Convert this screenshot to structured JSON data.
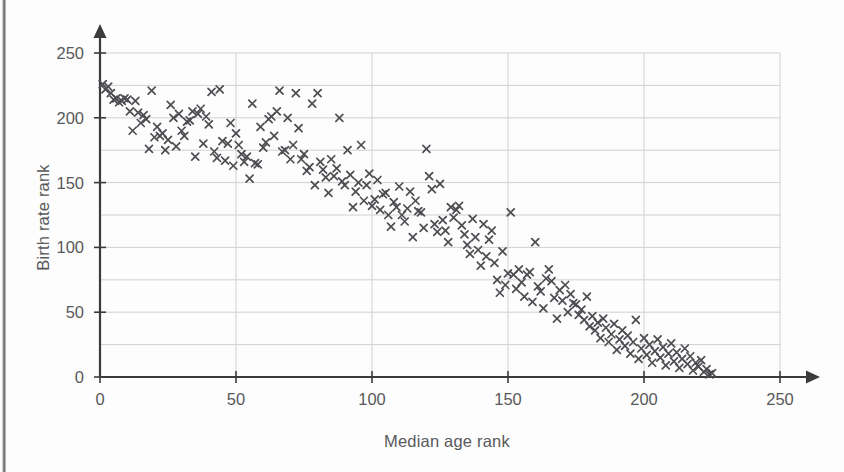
{
  "chart_data": {
    "type": "scatter",
    "title": "",
    "xlabel": "Median age rank",
    "ylabel": "Birth rate rank",
    "xlim": [
      0,
      250
    ],
    "ylim": [
      0,
      250
    ],
    "x_ticks": [
      0,
      50,
      100,
      150,
      200,
      250
    ],
    "y_ticks": [
      0,
      50,
      100,
      150,
      200,
      250
    ],
    "x_tick_labels": [
      "0",
      "50",
      "100",
      "150",
      "200",
      "250"
    ],
    "y_tick_labels": [
      "0",
      "50",
      "100",
      "150",
      "200",
      "250"
    ],
    "grid": "horizontal-every-25-and-vertical-every-50",
    "grid_color": "#d0d0d2",
    "marker": "x",
    "marker_color": "#4d4d52",
    "marker_size": 7,
    "legend": "none",
    "axis_style": "arrow-headed axes, origin at bottom-left",
    "n_points": 224,
    "points": [
      [
        1,
        226
      ],
      [
        2,
        222
      ],
      [
        3,
        224
      ],
      [
        4,
        219
      ],
      [
        5,
        214
      ],
      [
        6,
        215
      ],
      [
        7,
        212
      ],
      [
        8,
        213
      ],
      [
        9,
        215
      ],
      [
        10,
        214
      ],
      [
        11,
        205
      ],
      [
        12,
        190
      ],
      [
        13,
        213
      ],
      [
        14,
        204
      ],
      [
        15,
        196
      ],
      [
        16,
        202
      ],
      [
        17,
        199
      ],
      [
        18,
        176
      ],
      [
        19,
        221
      ],
      [
        20,
        185
      ],
      [
        21,
        193
      ],
      [
        22,
        186
      ],
      [
        23,
        188
      ],
      [
        24,
        175
      ],
      [
        25,
        183
      ],
      [
        26,
        210
      ],
      [
        27,
        200
      ],
      [
        28,
        178
      ],
      [
        29,
        203
      ],
      [
        30,
        190
      ],
      [
        31,
        186
      ],
      [
        32,
        197
      ],
      [
        33,
        198
      ],
      [
        34,
        205
      ],
      [
        35,
        170
      ],
      [
        36,
        203
      ],
      [
        37,
        207
      ],
      [
        38,
        180
      ],
      [
        39,
        201
      ],
      [
        40,
        195
      ],
      [
        41,
        220
      ],
      [
        42,
        174
      ],
      [
        43,
        169
      ],
      [
        44,
        222
      ],
      [
        45,
        182
      ],
      [
        46,
        167
      ],
      [
        47,
        180
      ],
      [
        48,
        196
      ],
      [
        49,
        163
      ],
      [
        50,
        188
      ],
      [
        51,
        179
      ],
      [
        52,
        172
      ],
      [
        53,
        166
      ],
      [
        54,
        170
      ],
      [
        55,
        153
      ],
      [
        56,
        211
      ],
      [
        57,
        165
      ],
      [
        58,
        164
      ],
      [
        59,
        193
      ],
      [
        60,
        177
      ],
      [
        61,
        181
      ],
      [
        62,
        199
      ],
      [
        63,
        201
      ],
      [
        64,
        186
      ],
      [
        65,
        205
      ],
      [
        66,
        221
      ],
      [
        67,
        174
      ],
      [
        68,
        175
      ],
      [
        69,
        200
      ],
      [
        70,
        168
      ],
      [
        71,
        179
      ],
      [
        72,
        219
      ],
      [
        73,
        192
      ],
      [
        74,
        168
      ],
      [
        75,
        172
      ],
      [
        76,
        159
      ],
      [
        77,
        162
      ],
      [
        78,
        211
      ],
      [
        79,
        148
      ],
      [
        80,
        219
      ],
      [
        81,
        166
      ],
      [
        82,
        160
      ],
      [
        83,
        154
      ],
      [
        84,
        142
      ],
      [
        85,
        168
      ],
      [
        86,
        155
      ],
      [
        87,
        161
      ],
      [
        88,
        200
      ],
      [
        89,
        151
      ],
      [
        90,
        148
      ],
      [
        91,
        175
      ],
      [
        92,
        156
      ],
      [
        93,
        131
      ],
      [
        94,
        143
      ],
      [
        95,
        150
      ],
      [
        96,
        179
      ],
      [
        97,
        136
      ],
      [
        98,
        148
      ],
      [
        99,
        157
      ],
      [
        100,
        132
      ],
      [
        101,
        137
      ],
      [
        102,
        152
      ],
      [
        103,
        129
      ],
      [
        104,
        141
      ],
      [
        105,
        142
      ],
      [
        106,
        125
      ],
      [
        107,
        116
      ],
      [
        108,
        135
      ],
      [
        109,
        131
      ],
      [
        110,
        147
      ],
      [
        111,
        125
      ],
      [
        112,
        120
      ],
      [
        113,
        130
      ],
      [
        114,
        143
      ],
      [
        115,
        108
      ],
      [
        116,
        136
      ],
      [
        117,
        128
      ],
      [
        118,
        127
      ],
      [
        119,
        115
      ],
      [
        120,
        176
      ],
      [
        121,
        155
      ],
      [
        122,
        145
      ],
      [
        123,
        118
      ],
      [
        124,
        112
      ],
      [
        125,
        149
      ],
      [
        126,
        121
      ],
      [
        127,
        113
      ],
      [
        128,
        104
      ],
      [
        129,
        131
      ],
      [
        130,
        123
      ],
      [
        131,
        129
      ],
      [
        132,
        132
      ],
      [
        133,
        117
      ],
      [
        134,
        110
      ],
      [
        135,
        102
      ],
      [
        136,
        95
      ],
      [
        137,
        122
      ],
      [
        138,
        108
      ],
      [
        139,
        98
      ],
      [
        140,
        86
      ],
      [
        141,
        118
      ],
      [
        142,
        93
      ],
      [
        143,
        106
      ],
      [
        144,
        113
      ],
      [
        145,
        88
      ],
      [
        146,
        75
      ],
      [
        147,
        65
      ],
      [
        148,
        97
      ],
      [
        149,
        71
      ],
      [
        150,
        80
      ],
      [
        151,
        127
      ],
      [
        152,
        79
      ],
      [
        153,
        68
      ],
      [
        154,
        83
      ],
      [
        155,
        73
      ],
      [
        156,
        62
      ],
      [
        157,
        79
      ],
      [
        158,
        81
      ],
      [
        159,
        58
      ],
      [
        160,
        104
      ],
      [
        161,
        70
      ],
      [
        162,
        66
      ],
      [
        163,
        53
      ],
      [
        164,
        76
      ],
      [
        165,
        83
      ],
      [
        166,
        74
      ],
      [
        167,
        61
      ],
      [
        168,
        45
      ],
      [
        169,
        67
      ],
      [
        170,
        59
      ],
      [
        171,
        71
      ],
      [
        172,
        50
      ],
      [
        173,
        64
      ],
      [
        174,
        57
      ],
      [
        175,
        56
      ],
      [
        176,
        48
      ],
      [
        177,
        52
      ],
      [
        178,
        44
      ],
      [
        179,
        62
      ],
      [
        180,
        39
      ],
      [
        181,
        47
      ],
      [
        182,
        36
      ],
      [
        183,
        42
      ],
      [
        184,
        30
      ],
      [
        185,
        45
      ],
      [
        186,
        38
      ],
      [
        187,
        27
      ],
      [
        188,
        33
      ],
      [
        189,
        41
      ],
      [
        190,
        21
      ],
      [
        191,
        29
      ],
      [
        192,
        36
      ],
      [
        193,
        24
      ],
      [
        194,
        32
      ],
      [
        195,
        18
      ],
      [
        196,
        27
      ],
      [
        197,
        44
      ],
      [
        198,
        14
      ],
      [
        199,
        22
      ],
      [
        200,
        30
      ],
      [
        201,
        17
      ],
      [
        202,
        25
      ],
      [
        203,
        11
      ],
      [
        204,
        20
      ],
      [
        205,
        29
      ],
      [
        206,
        15
      ],
      [
        207,
        23
      ],
      [
        208,
        9
      ],
      [
        209,
        18
      ],
      [
        210,
        26
      ],
      [
        211,
        12
      ],
      [
        212,
        19
      ],
      [
        213,
        7
      ],
      [
        214,
        14
      ],
      [
        215,
        22
      ],
      [
        216,
        10
      ],
      [
        217,
        16
      ],
      [
        218,
        5
      ],
      [
        219,
        11
      ],
      [
        220,
        8
      ],
      [
        221,
        13
      ],
      [
        222,
        4
      ],
      [
        223,
        6
      ],
      [
        224,
        2
      ],
      [
        225,
        3
      ]
    ]
  },
  "axis_titles": {
    "x": "Median age rank",
    "y": "Birth rate rank"
  }
}
